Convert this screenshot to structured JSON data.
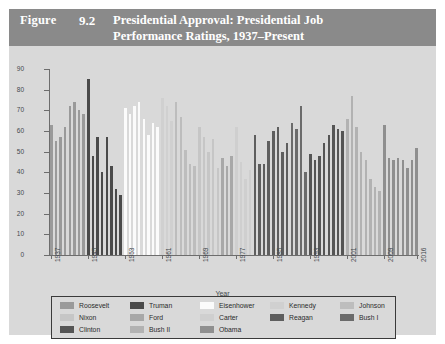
{
  "header": {
    "figure_word": "Figure",
    "figure_number": "9.2",
    "title_line1": "Presidential Approval: Presidential Job",
    "title_line2": "Performance Ratings, 1937–Present",
    "band_color": "#8a8a8a",
    "text_color": "#ffffff"
  },
  "chart_data": {
    "type": "bar",
    "xlabel": "Year",
    "ylabel": "Percent",
    "ylim": [
      0,
      90
    ],
    "yticks": [
      0,
      10,
      20,
      30,
      40,
      50,
      60,
      70,
      80,
      90
    ],
    "xlim": [
      1937,
      2016
    ],
    "xticks": [
      1937,
      1945,
      1953,
      1961,
      1969,
      1977,
      1985,
      1993,
      2001,
      2009,
      2016
    ],
    "grid": false,
    "legend_position": "bottom",
    "series": [
      {
        "name": "Roosevelt",
        "color": "#9a9a9a",
        "x": [
          1937,
          1938,
          1939,
          1940,
          1941,
          1942,
          1943,
          1944
        ],
        "values": [
          63,
          55,
          57,
          62,
          72,
          74,
          70,
          68
        ]
      },
      {
        "name": "Truman",
        "color": "#4a4a4a",
        "x": [
          1945,
          1946,
          1947,
          1948,
          1949,
          1950,
          1951,
          1952
        ],
        "values": [
          85,
          48,
          57,
          40,
          57,
          43,
          32,
          29
        ]
      },
      {
        "name": "Eisenhower",
        "color": "#fbfbfb",
        "x": [
          1953,
          1954,
          1955,
          1956,
          1957,
          1958,
          1959,
          1960
        ],
        "values": [
          71,
          68,
          72,
          74,
          66,
          58,
          64,
          62
        ]
      },
      {
        "name": "Kennedy",
        "color": "#d0d0d0",
        "x": [
          1961,
          1962,
          1963
        ],
        "values": [
          76,
          72,
          65
        ]
      },
      {
        "name": "Johnson",
        "color": "#bdbdbd",
        "x": [
          1964,
          1965,
          1966,
          1967,
          1968
        ],
        "values": [
          74,
          67,
          51,
          44,
          43
        ]
      },
      {
        "name": "Nixon",
        "color": "#c6c6c6",
        "x": [
          1969,
          1970,
          1971,
          1972,
          1973,
          1974
        ],
        "values": [
          62,
          57,
          50,
          56,
          42,
          26
        ]
      },
      {
        "name": "Ford",
        "color": "#a8a8a8",
        "x": [
          1974,
          1975,
          1976
        ],
        "values": [
          47,
          43,
          48
        ]
      },
      {
        "name": "Carter",
        "color": "#cfcfcf",
        "x": [
          1977,
          1978,
          1979,
          1980
        ],
        "values": [
          62,
          45,
          37,
          41
        ]
      },
      {
        "name": "Reagan",
        "color": "#5e5e5e",
        "x": [
          1981,
          1982,
          1983,
          1984,
          1985,
          1986,
          1987,
          1988
        ],
        "values": [
          58,
          44,
          44,
          55,
          60,
          62,
          50,
          54
        ]
      },
      {
        "name": "Bush I",
        "color": "#6b6b6b",
        "x": [
          1989,
          1990,
          1991,
          1992
        ],
        "values": [
          64,
          61,
          72,
          40
        ]
      },
      {
        "name": "Clinton",
        "color": "#555555",
        "x": [
          1993,
          1994,
          1995,
          1996,
          1997,
          1998,
          1999,
          2000
        ],
        "values": [
          49,
          46,
          48,
          54,
          58,
          63,
          61,
          60
        ]
      },
      {
        "name": "Bush II",
        "color": "#b2b2b2",
        "x": [
          2001,
          2002,
          2003,
          2004,
          2005,
          2006,
          2007,
          2008
        ],
        "values": [
          66,
          77,
          62,
          50,
          46,
          37,
          33,
          31
        ]
      },
      {
        "name": "Obama",
        "color": "#8f8f8f",
        "x": [
          2009,
          2010,
          2011,
          2012,
          2013,
          2014,
          2015,
          2016
        ],
        "values": [
          63,
          47,
          46,
          47,
          46,
          42,
          46,
          52
        ]
      }
    ]
  },
  "legend": {
    "rows": [
      [
        {
          "label": "Roosevelt",
          "color": "#9a9a9a"
        },
        {
          "label": "Truman",
          "color": "#4a4a4a"
        },
        {
          "label": "Eisenhower",
          "color": "#fbfbfb"
        },
        {
          "label": "Kennedy",
          "color": "#d0d0d0"
        },
        {
          "label": "Johnson",
          "color": "#bdbdbd"
        }
      ],
      [
        {
          "label": "Nixon",
          "color": "#c6c6c6"
        },
        {
          "label": "Ford",
          "color": "#a8a8a8"
        },
        {
          "label": "Carter",
          "color": "#cfcfcf"
        },
        {
          "label": "Reagan",
          "color": "#5e5e5e"
        },
        {
          "label": "Bush I",
          "color": "#6b6b6b"
        }
      ],
      [
        {
          "label": "Clinton",
          "color": "#555555"
        },
        {
          "label": "Bush II",
          "color": "#b2b2b2"
        },
        {
          "label": "Obama",
          "color": "#8f8f8f"
        }
      ]
    ]
  }
}
